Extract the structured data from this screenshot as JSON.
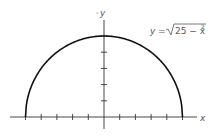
{
  "chart_data": {
    "type": "line",
    "title": "",
    "equation": "y = √(25 − x²)",
    "equation_parts": {
      "lhs": "y",
      "eq": "=",
      "radicand": "25 − x",
      "exponent": "2"
    },
    "xlabel": "x",
    "ylabel": "y",
    "xlim": [
      -5,
      5
    ],
    "ylim": [
      0,
      5
    ],
    "x_ticks": [
      -5,
      -4,
      -3,
      -2,
      -1,
      1,
      2,
      3,
      4,
      5
    ],
    "y_ticks": [
      1,
      2,
      3,
      4,
      5
    ],
    "tick_labels_shown": false,
    "grid": false,
    "legend": null,
    "series": [
      {
        "name": "y = sqrt(25 - x^2)",
        "x": [
          -5,
          -4,
          -3,
          -2,
          -1,
          0,
          1,
          2,
          3,
          4,
          5
        ],
        "y": [
          0,
          3,
          4,
          4.58,
          4.9,
          5,
          4.9,
          4.58,
          4,
          3,
          0
        ]
      }
    ],
    "colors": {
      "curve": "#111111",
      "axes": "#333333",
      "text": "#555555"
    }
  }
}
